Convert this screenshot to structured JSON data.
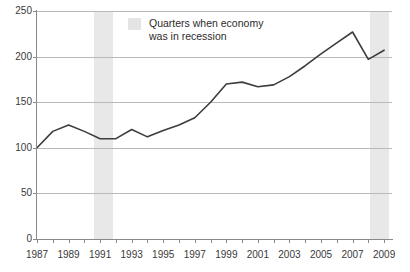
{
  "chart_data": {
    "type": "line",
    "title": "",
    "subtitle": "",
    "xlabel": "",
    "ylabel": "",
    "xlim": [
      1987,
      2009.5
    ],
    "ylim": [
      0,
      250
    ],
    "grid": true,
    "legend_position": "top-center",
    "y_ticks": [
      0,
      50,
      100,
      150,
      200,
      250
    ],
    "y_tick_labels": [
      "0",
      "50",
      "100",
      "150",
      "200",
      "250"
    ],
    "x_ticks": [
      1987,
      1988,
      1989,
      1990,
      1991,
      1992,
      1993,
      1994,
      1995,
      1996,
      1997,
      1998,
      1999,
      2000,
      2001,
      2002,
      2003,
      2004,
      2005,
      2006,
      2007,
      2008,
      2009
    ],
    "x_tick_labels": [
      "1987",
      "",
      "1989",
      "",
      "1991",
      "",
      "1993",
      "",
      "1995",
      "",
      "1997",
      "",
      "1999",
      "",
      "2001",
      "",
      "2003",
      "",
      "2005",
      "",
      "2007",
      "",
      "2009"
    ],
    "x_visible_labels": [
      "1987",
      "1989",
      "1991",
      "1993",
      "1995",
      "1997",
      "1999",
      "2001",
      "2003",
      "2005",
      "2007",
      "2009"
    ],
    "x": [
      1987,
      1988,
      1989,
      1990,
      1991,
      1992,
      1993,
      1994,
      1995,
      1996,
      1997,
      1998,
      1999,
      2000,
      2001,
      2002,
      2003,
      2004,
      2005,
      2006,
      2007,
      2008,
      2009
    ],
    "values": [
      100,
      118,
      125,
      118,
      110,
      110,
      120,
      112,
      119,
      125,
      133,
      150,
      170,
      172,
      167,
      169,
      178,
      190,
      203,
      215,
      227,
      197,
      207
    ],
    "series": [
      {
        "name": "series-1",
        "color": "#3d3d3d",
        "values": [
          100,
          118,
          125,
          118,
          110,
          110,
          120,
          112,
          119,
          125,
          133,
          150,
          170,
          172,
          167,
          169,
          178,
          190,
          203,
          215,
          227,
          197,
          207
        ]
      }
    ],
    "shaded_regions": [
      {
        "label": "recession-band-1",
        "x_start": 1990.6,
        "x_end": 1991.8,
        "color": "#e8e8e8"
      },
      {
        "label": "recession-band-2",
        "x_start": 2008.1,
        "x_end": 2009.3,
        "color": "#e8e8e8"
      }
    ],
    "annotations": []
  },
  "legend": {
    "swatch_color": "#e4e4e4",
    "text": "Quarters when economy\nwas in recession"
  },
  "colors": {
    "line": "#3d3d3d",
    "grid": "#b9b9b9",
    "axis": "#8a8a8a",
    "band": "#e8e8e8",
    "text": "#3a3a3a",
    "background": "#ffffff"
  }
}
